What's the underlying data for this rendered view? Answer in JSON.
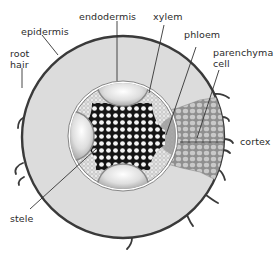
{
  "diagram": {
    "labels": {
      "epidermis": "epidermis",
      "endodermis": "endodermis",
      "xylem": "xylem",
      "phloem": "phloem",
      "parenchyma_line1": "parenchyma",
      "parenchyma_line2": "cell",
      "root_hair_line1": "root",
      "root_hair_line2": "hair",
      "cortex": "cortex",
      "stele": "stele"
    },
    "colors": {
      "epidermis_stroke": "#3a3a3a",
      "cortex_fill": "#dcdcdc",
      "stele_ring": "#ffffff",
      "xylem_dark": "#1a1a1a",
      "phloem_gray": "#b5b5b5",
      "parenchyma_cells": "#9a9a9a",
      "leader_line": "#333333"
    }
  }
}
